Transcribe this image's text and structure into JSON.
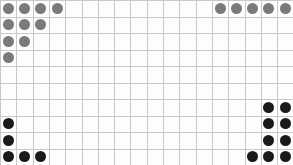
{
  "board": {
    "name": "dot-grid-board",
    "columns": 18,
    "rows": 10,
    "cell_width": 16.3,
    "cell_height": 16.5,
    "width": 293,
    "height": 165,
    "background_color": "#fdfdfd",
    "gridline_color": "#c9c9c9",
    "gridline_faint_color": "#e4e4e4"
  },
  "legend": {
    "gray_label": "gray-token",
    "dark_label": "dark-token",
    "gray_color": "#7a7a7a",
    "dark_color": "#1a1a1a"
  },
  "dots": [
    {
      "id": "gray-r0-c0",
      "row": 0,
      "col": 0,
      "color": "gray"
    },
    {
      "id": "gray-r0-c1",
      "row": 0,
      "col": 1,
      "color": "gray"
    },
    {
      "id": "gray-r0-c2",
      "row": 0,
      "col": 2,
      "color": "gray"
    },
    {
      "id": "gray-r0-c3",
      "row": 0,
      "col": 3,
      "color": "gray"
    },
    {
      "id": "gray-r0-c13",
      "row": 0,
      "col": 13,
      "color": "gray"
    },
    {
      "id": "gray-r0-c14",
      "row": 0,
      "col": 14,
      "color": "gray"
    },
    {
      "id": "gray-r0-c15",
      "row": 0,
      "col": 15,
      "color": "gray"
    },
    {
      "id": "gray-r0-c16",
      "row": 0,
      "col": 16,
      "color": "gray"
    },
    {
      "id": "gray-r0-c17",
      "row": 0,
      "col": 17,
      "color": "gray"
    },
    {
      "id": "gray-r1-c0",
      "row": 1,
      "col": 0,
      "color": "gray"
    },
    {
      "id": "gray-r1-c1",
      "row": 1,
      "col": 1,
      "color": "gray"
    },
    {
      "id": "gray-r1-c2",
      "row": 1,
      "col": 2,
      "color": "gray"
    },
    {
      "id": "gray-r2-c0",
      "row": 2,
      "col": 0,
      "color": "gray"
    },
    {
      "id": "gray-r2-c1",
      "row": 2,
      "col": 1,
      "color": "gray"
    },
    {
      "id": "gray-r3-c0",
      "row": 3,
      "col": 0,
      "color": "gray"
    },
    {
      "id": "dark-r6-c16",
      "row": 6,
      "col": 16,
      "color": "dark"
    },
    {
      "id": "dark-r6-c17",
      "row": 6,
      "col": 17,
      "color": "dark"
    },
    {
      "id": "dark-r7-c0",
      "row": 7,
      "col": 0,
      "color": "dark"
    },
    {
      "id": "dark-r7-c16",
      "row": 7,
      "col": 16,
      "color": "dark"
    },
    {
      "id": "dark-r7-c17",
      "row": 7,
      "col": 17,
      "color": "dark"
    },
    {
      "id": "dark-r8-c0",
      "row": 8,
      "col": 0,
      "color": "dark"
    },
    {
      "id": "dark-r8-c16",
      "row": 8,
      "col": 16,
      "color": "dark"
    },
    {
      "id": "dark-r8-c17",
      "row": 8,
      "col": 17,
      "color": "dark"
    },
    {
      "id": "dark-r9-c0",
      "row": 9,
      "col": 0,
      "color": "dark"
    },
    {
      "id": "dark-r9-c1",
      "row": 9,
      "col": 1,
      "color": "dark"
    },
    {
      "id": "dark-r9-c2",
      "row": 9,
      "col": 2,
      "color": "dark"
    },
    {
      "id": "dark-r9-c15",
      "row": 9,
      "col": 15,
      "color": "dark"
    },
    {
      "id": "dark-r9-c16",
      "row": 9,
      "col": 16,
      "color": "dark"
    },
    {
      "id": "dark-r9-c17",
      "row": 9,
      "col": 17,
      "color": "dark"
    }
  ]
}
